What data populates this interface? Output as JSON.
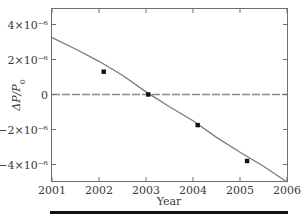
{
  "chart_data": {
    "type": "line",
    "title": "",
    "xlabel": "Year",
    "ylabel": "ΔP/P0",
    "xlim": [
      2001,
      2006
    ],
    "ylim": [
      -5e-06,
      5e-06
    ],
    "x_ticks": [
      2001,
      2002,
      2003,
      2004,
      2005,
      2006
    ],
    "x_tick_labels": [
      "2001",
      "2002",
      "2003",
      "2004",
      "2005",
      "2006"
    ],
    "y_ticks": [
      4e-06,
      2e-06,
      0,
      -2e-06,
      -4e-06
    ],
    "y_tick_labels": [
      "4×10⁻⁶",
      "2×10⁻⁶",
      "0",
      "−2×10⁻⁶",
      "−4×10⁻⁶"
    ],
    "grid": false,
    "zero_line": {
      "style": "dashed",
      "y": 0
    },
    "series": [
      {
        "name": "fit",
        "type": "line",
        "color": "#7a7a7a",
        "x": [
          2001.0,
          2001.5,
          2002.0,
          2002.5,
          2003.0,
          2003.5,
          2004.0,
          2004.5,
          2005.0,
          2005.5,
          2006.0
        ],
        "y": [
          3.25e-06,
          2.6e-06,
          1.9e-06,
          1.1e-06,
          1.5e-07,
          -7e-07,
          -1.5e-06,
          -2.45e-06,
          -3.3e-06,
          -4.1e-06,
          -5e-06
        ]
      },
      {
        "name": "measurements",
        "type": "scatter",
        "marker": "square",
        "color": "#111111",
        "x": [
          2002.1,
          2003.05,
          2004.1,
          2005.15
        ],
        "y": [
          1.3e-06,
          0.0,
          -1.75e-06,
          -3.8e-06
        ]
      }
    ]
  }
}
